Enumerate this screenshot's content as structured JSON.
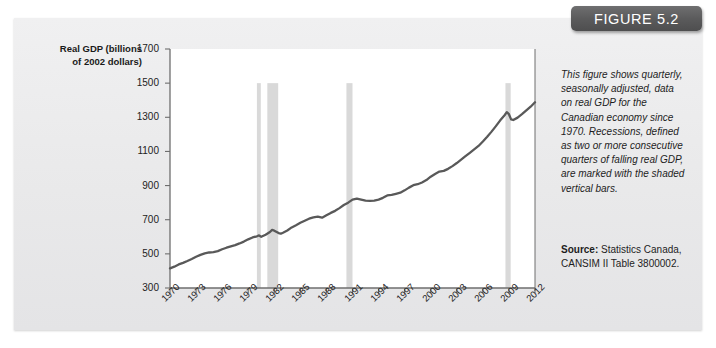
{
  "figure": {
    "badge_label": "FIGURE 5.2"
  },
  "caption": {
    "text": "This figure shows quarterly, seasonally adjusted, data on real GDP for the Canadian economy since 1970. Recessions, defined as two or more consecutive quarters of falling real GDP, are marked with the shaded vertical bars."
  },
  "source": {
    "label": "Source:",
    "text": " Statistics Canada, CANSIM II Table 3800002."
  },
  "colors": {
    "page_background": "#ececed",
    "plot_background": "#ffffff",
    "line": "#595959",
    "recession_bar": "#d9d9d9",
    "axis": "#6e6e6e",
    "badge": "#5b5b5c",
    "text": "#1d1d1d"
  },
  "chart_data": {
    "type": "line",
    "title": "",
    "subtitle": "",
    "xlabel": "",
    "ylabel": "Real GDP (billions of 2002 dollars)",
    "ylabel_line1": "Real GDP (billions",
    "ylabel_line2": "of 2002 dollars)",
    "grid": false,
    "legend": "none",
    "xlim": [
      1970,
      2012
    ],
    "ylim": [
      300,
      1700
    ],
    "ytick_labels": [
      "300",
      "500",
      "700",
      "900",
      "1100",
      "1300",
      "1500",
      "1700"
    ],
    "yticks": [
      300,
      500,
      700,
      900,
      1100,
      1300,
      1500,
      1700
    ],
    "xtick_labels": [
      "1970",
      "1973",
      "1976",
      "1979",
      "1982",
      "1985",
      "1988",
      "1991",
      "1994",
      "1997",
      "2000",
      "2003",
      "2006",
      "2009",
      "2012"
    ],
    "xticks": [
      1970,
      1973,
      1976,
      1979,
      1982,
      1985,
      1988,
      1991,
      1994,
      1997,
      2000,
      2003,
      2006,
      2009,
      2012
    ],
    "series": [
      {
        "name": "Real GDP",
        "x": [
          1970.0,
          1970.5,
          1971.0,
          1971.5,
          1972.0,
          1972.5,
          1973.0,
          1973.5,
          1974.0,
          1974.5,
          1975.0,
          1975.5,
          1976.0,
          1976.5,
          1977.0,
          1977.5,
          1978.0,
          1978.5,
          1979.0,
          1979.5,
          1980.0,
          1980.25,
          1980.5,
          1981.0,
          1981.5,
          1981.75,
          1982.0,
          1982.5,
          1982.75,
          1983.0,
          1983.5,
          1984.0,
          1984.5,
          1985.0,
          1985.5,
          1986.0,
          1986.5,
          1987.0,
          1987.5,
          1988.0,
          1988.5,
          1989.0,
          1989.5,
          1990.0,
          1990.5,
          1991.0,
          1991.5,
          1992.0,
          1992.5,
          1993.0,
          1993.5,
          1994.0,
          1994.5,
          1995.0,
          1995.5,
          1996.0,
          1996.5,
          1997.0,
          1997.5,
          1998.0,
          1998.5,
          1999.0,
          1999.5,
          2000.0,
          2000.5,
          2001.0,
          2001.5,
          2002.0,
          2002.5,
          2003.0,
          2003.5,
          2004.0,
          2004.5,
          2005.0,
          2005.5,
          2006.0,
          2006.5,
          2007.0,
          2007.5,
          2008.0,
          2008.5,
          2008.75,
          2009.0,
          2009.25,
          2009.5,
          2010.0,
          2010.5,
          2011.0,
          2011.5,
          2012.0
        ],
        "values": [
          415,
          425,
          438,
          447,
          458,
          470,
          483,
          494,
          503,
          508,
          510,
          516,
          527,
          536,
          544,
          551,
          561,
          572,
          585,
          596,
          603,
          608,
          600,
          612,
          628,
          640,
          636,
          622,
          618,
          624,
          637,
          655,
          668,
          682,
          694,
          706,
          714,
          718,
          712,
          726,
          740,
          752,
          768,
          786,
          800,
          818,
          824,
          818,
          812,
          810,
          812,
          818,
          828,
          842,
          846,
          852,
          858,
          872,
          888,
          902,
          908,
          918,
          932,
          952,
          968,
          982,
          986,
          998,
          1014,
          1032,
          1052,
          1072,
          1092,
          1112,
          1132,
          1158,
          1186,
          1216,
          1248,
          1282,
          1312,
          1330,
          1318,
          1288,
          1284,
          1298,
          1318,
          1340,
          1362,
          1388
        ]
      }
    ],
    "recession_bars": [
      {
        "label": "1980 recession",
        "start": 1980.0,
        "end": 1980.45,
        "ytop": 1500
      },
      {
        "label": "1981-82 recession",
        "start": 1981.2,
        "end": 1982.45,
        "ytop": 1500
      },
      {
        "label": "1990-91 recession",
        "start": 1990.3,
        "end": 1991.0,
        "ytop": 1500
      },
      {
        "label": "2008-09 recession",
        "start": 2008.6,
        "end": 2009.2,
        "ytop": 1500
      }
    ]
  }
}
